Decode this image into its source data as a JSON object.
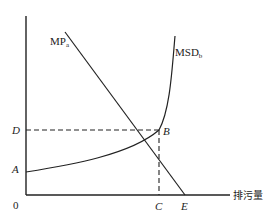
{
  "diagram": {
    "type": "economics-pollution-diagram",
    "axes": {
      "origin_label": "0",
      "x_axis_label": "排污量",
      "y_axis_label": ""
    },
    "curves": [
      {
        "id": "mp",
        "label_main": "MP",
        "label_sub": "a",
        "shape": "downward-sloping straight line",
        "ends_at": "E"
      },
      {
        "id": "msd",
        "label_main": "MSD",
        "label_sub": "b",
        "shape": "upward-sloping convex curve",
        "starts_at": "A"
      }
    ],
    "points": {
      "A": "A",
      "B": "B",
      "C": "C",
      "D": "D",
      "E": "E"
    },
    "guides": [
      {
        "from": "D",
        "to": "B",
        "style": "dashed"
      },
      {
        "from": "B",
        "to": "C",
        "style": "dashed"
      }
    ],
    "colors": {
      "line": "#222222",
      "background": "#ffffff"
    }
  }
}
